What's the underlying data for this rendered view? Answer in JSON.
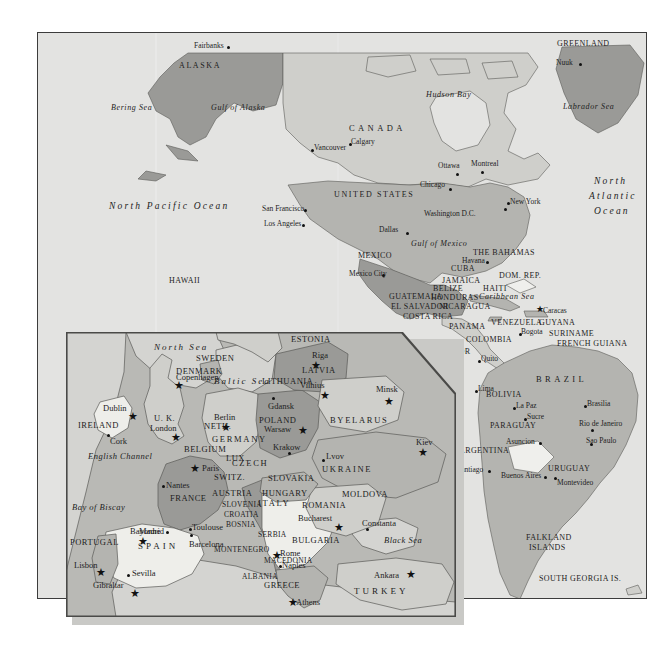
{
  "map": {
    "title": "World map with Europe inset",
    "colors": {
      "ocean": "#e3e3e1",
      "land_light": "#cfcfcb",
      "land_mid": "#b4b4b0",
      "land_dark": "#9a9a97",
      "land_white": "#efefec",
      "border": "#3c3c3c",
      "inset_shadow": "#c9c9c6",
      "text": "#1d1d1d"
    },
    "world": {
      "oceans": [
        {
          "name": "Bering Sea",
          "x": 110,
          "y": 107
        },
        {
          "name": "Gulf of Alaska",
          "x": 210,
          "y": 107
        },
        {
          "name": "North Pacific Ocean",
          "x": 108,
          "y": 205
        },
        {
          "name": "Hudson Bay",
          "x": 425,
          "y": 94
        },
        {
          "name": "Labrador Sea",
          "x": 562,
          "y": 106
        },
        {
          "name": "North",
          "x": 593,
          "y": 180
        },
        {
          "name": "Atlantic",
          "x": 588,
          "y": 195
        },
        {
          "name": "Ocean",
          "x": 593,
          "y": 210
        },
        {
          "name": "Gulf of Mexico",
          "x": 410,
          "y": 243
        },
        {
          "name": "Caribbean Sea",
          "x": 478,
          "y": 296
        }
      ],
      "regions": [
        {
          "name": "ALASKA",
          "x": 178,
          "y": 65,
          "style": "country-mid"
        },
        {
          "name": "CANADA",
          "x": 348,
          "y": 127,
          "style": "country-big"
        },
        {
          "name": "UNITED  STATES",
          "x": 333,
          "y": 194,
          "style": "country-mid"
        },
        {
          "name": "GREENLAND",
          "x": 556,
          "y": 43,
          "style": "country"
        },
        {
          "name": "MEXICO",
          "x": 357,
          "y": 255,
          "style": "country"
        },
        {
          "name": "HAWAII",
          "x": 168,
          "y": 280,
          "style": "country"
        },
        {
          "name": "THE BAHAMAS",
          "x": 472,
          "y": 252,
          "style": "country"
        },
        {
          "name": "CUBA",
          "x": 450,
          "y": 268,
          "style": "country"
        },
        {
          "name": "JAMAICA",
          "x": 441,
          "y": 280,
          "style": "country"
        },
        {
          "name": "HAITI",
          "x": 482,
          "y": 288,
          "style": "country"
        },
        {
          "name": "DOM. REP.",
          "x": 498,
          "y": 275,
          "style": "country"
        },
        {
          "name": "BELIZE",
          "x": 432,
          "y": 288,
          "style": "country"
        },
        {
          "name": "GUATEMALA",
          "x": 388,
          "y": 296,
          "style": "country"
        },
        {
          "name": "HONDURAS",
          "x": 430,
          "y": 297,
          "style": "country"
        },
        {
          "name": "EL SALVADOR",
          "x": 390,
          "y": 306,
          "style": "country"
        },
        {
          "name": "NICARAGUA",
          "x": 438,
          "y": 306,
          "style": "country"
        },
        {
          "name": "COSTA RICA",
          "x": 402,
          "y": 316,
          "style": "country"
        },
        {
          "name": "PANAMA",
          "x": 448,
          "y": 326,
          "style": "country"
        },
        {
          "name": "VENEZUELA",
          "x": 490,
          "y": 322,
          "style": "country"
        },
        {
          "name": "GUYANA",
          "x": 538,
          "y": 322,
          "style": "country"
        },
        {
          "name": "SURINAME",
          "x": 548,
          "y": 333,
          "style": "country"
        },
        {
          "name": "FRENCH GUIANA",
          "x": 556,
          "y": 343,
          "style": "country"
        },
        {
          "name": "COLOMBIA",
          "x": 465,
          "y": 339,
          "style": "country"
        },
        {
          "name": "ECUADOR",
          "x": 428,
          "y": 351,
          "style": "country"
        },
        {
          "name": "PERU",
          "x": 439,
          "y": 374,
          "style": "country"
        },
        {
          "name": "BRAZIL",
          "x": 539,
          "y": 378,
          "style": "country-big"
        },
        {
          "name": "BOLIVIA",
          "x": 485,
          "y": 394,
          "style": "country"
        },
        {
          "name": "PARAGUAY",
          "x": 489,
          "y": 425,
          "style": "country"
        },
        {
          "name": "CHILE",
          "x": 437,
          "y": 437,
          "style": "country"
        },
        {
          "name": "ARGENTINA",
          "x": 458,
          "y": 450,
          "style": "country"
        },
        {
          "name": "URUGUAY",
          "x": 547,
          "y": 468,
          "style": "country"
        },
        {
          "name": "FALKLAND",
          "x": 525,
          "y": 537,
          "style": "country"
        },
        {
          "name": "ISLANDS",
          "x": 528,
          "y": 547,
          "style": "country"
        },
        {
          "name": "SOUTH GEORGIA IS.",
          "x": 562,
          "y": 578,
          "style": "country"
        }
      ],
      "cities": [
        {
          "name": "Fairbanks",
          "x": 189,
          "y": 45,
          "dx": 31,
          "dy": 9,
          "marker": "dot"
        },
        {
          "name": "Vancouver",
          "x": 310,
          "y": 145,
          "dx": -6,
          "dy": -1,
          "marker": "dot"
        },
        {
          "name": "Calgary",
          "x": 348,
          "y": 144,
          "dx": -4,
          "dy": 8,
          "marker": "dot"
        },
        {
          "name": "Ottawa",
          "x": 452,
          "y": 168,
          "dx": 12,
          "dy": 9,
          "marker": "dot"
        },
        {
          "name": "Montreal",
          "x": 478,
          "y": 166,
          "dx": 9,
          "dy": 10,
          "marker": "dot"
        },
        {
          "name": "Chicago",
          "x": 415,
          "y": 184,
          "dx": 24,
          "dy": 9,
          "marker": "dot"
        },
        {
          "name": "New York",
          "x": 485,
          "y": 202,
          "dx": -4,
          "dy": -1,
          "marker": "dot"
        },
        {
          "name": "Washington D.C.",
          "x": 424,
          "y": 211,
          "dx": 54,
          "dy": 1,
          "marker": "dot"
        },
        {
          "name": "San Francisco",
          "x": 263,
          "y": 208,
          "dx": 49,
          "dy": 1,
          "marker": "dot"
        },
        {
          "name": "Los Angeles",
          "x": 272,
          "y": 223,
          "dx": 44,
          "dy": 1,
          "marker": "dot"
        },
        {
          "name": "Dallas",
          "x": 378,
          "y": 228,
          "dx": 24,
          "dy": 6,
          "marker": "dot"
        },
        {
          "name": "Mexico City",
          "x": 368,
          "y": 273,
          "dx": 34,
          "dy": 5,
          "marker": "dot"
        },
        {
          "name": "Havana",
          "x": 440,
          "y": 262,
          "dx": 26,
          "dy": 3,
          "marker": "dot"
        },
        {
          "name": "Nuuk",
          "x": 540,
          "y": 62,
          "dx": 22,
          "dy": 1,
          "marker": "dot"
        },
        {
          "name": "Caracas",
          "x": 510,
          "y": 310,
          "dx": -3,
          "dy": 6,
          "marker": "star"
        },
        {
          "name": "Bogota",
          "x": 487,
          "y": 330,
          "dx": -1,
          "dy": 6,
          "marker": "dot"
        },
        {
          "name": "Quito",
          "x": 442,
          "y": 360,
          "dx": 0,
          "dy": 5,
          "marker": "dot"
        },
        {
          "name": "Lima",
          "x": 443,
          "y": 388,
          "dx": 1,
          "dy": 5,
          "marker": "dot"
        },
        {
          "name": "La Paz",
          "x": 490,
          "y": 403,
          "dx": -1,
          "dy": 6,
          "marker": "dot"
        },
        {
          "name": "Sucre",
          "x": 497,
          "y": 412,
          "dx": 2,
          "dy": 6,
          "marker": "dot"
        },
        {
          "name": "Brasilia",
          "x": 578,
          "y": 399,
          "dx": -3,
          "dy": 6,
          "marker": "dot"
        },
        {
          "name": "Rio de Janeiro",
          "x": 580,
          "y": 420,
          "dx": 4,
          "dy": 6,
          "marker": "dot"
        },
        {
          "name": "Sao Paulo",
          "x": 580,
          "y": 436,
          "dx": 2,
          "dy": 3,
          "marker": "dot"
        },
        {
          "name": "Asuncion",
          "x": 484,
          "y": 437,
          "dx": 0,
          "dy": 5,
          "marker": "dot"
        },
        {
          "name": "Santiago",
          "x": 439,
          "y": 466,
          "dx": 0,
          "dy": 6,
          "marker": "dot"
        },
        {
          "name": "Buenos Aires",
          "x": 470,
          "y": 472,
          "dx": 0,
          "dy": 6,
          "marker": "dot"
        },
        {
          "name": "Montevideo",
          "x": 547,
          "y": 478,
          "dx": -2,
          "dy": 2,
          "marker": "dot"
        }
      ]
    },
    "europe": {
      "oceans": [
        {
          "name": "North Sea",
          "x": 98,
          "y": 17
        },
        {
          "name": "Baltic Sea",
          "x": 167,
          "y": 50
        },
        {
          "name": "English Channel",
          "x": 30,
          "y": 125
        },
        {
          "name": "Bay of Biscay",
          "x": 6,
          "y": 175
        },
        {
          "name": "Black Sea",
          "x": 324,
          "y": 210
        }
      ],
      "regions": [
        {
          "name": "ESTONIA",
          "x": 252,
          "y": 6,
          "style": "e-country"
        },
        {
          "name": "SWEDEN",
          "x": 146,
          "y": 25,
          "style": "e-country"
        },
        {
          "name": "DENMARK",
          "x": 110,
          "y": 34,
          "style": "e-country"
        },
        {
          "name": "LATVIA",
          "x": 256,
          "y": 36,
          "style": "e-country"
        },
        {
          "name": "LITHUANIA",
          "x": 228,
          "y": 48,
          "style": "e-country"
        },
        {
          "name": "IRELAND",
          "x": 12,
          "y": 92,
          "style": "e-country"
        },
        {
          "name": "U. K.",
          "x": 92,
          "y": 81,
          "style": "e-country"
        },
        {
          "name": "NETH.",
          "x": 142,
          "y": 86,
          "style": "e-country"
        },
        {
          "name": "BELGIUM",
          "x": 125,
          "y": 112,
          "style": "e-country"
        },
        {
          "name": "LUX.",
          "x": 160,
          "y": 121,
          "style": "e-country"
        },
        {
          "name": "GERMANY",
          "x": 164,
          "y": 105,
          "style": "e-country-md"
        },
        {
          "name": "POLAND",
          "x": 212,
          "y": 85,
          "style": "e-country"
        },
        {
          "name": "BYELARUS",
          "x": 294,
          "y": 85,
          "style": "e-country-md"
        },
        {
          "name": "CZECH",
          "x": 184,
          "y": 127,
          "style": "e-country-md"
        },
        {
          "name": "SLOVAKIA",
          "x": 222,
          "y": 142,
          "style": "e-country"
        },
        {
          "name": "UKRAINE",
          "x": 288,
          "y": 134,
          "style": "e-country-md"
        },
        {
          "name": "AUSTRIA",
          "x": 173,
          "y": 157,
          "style": "e-country"
        },
        {
          "name": "HUNGARY",
          "x": 217,
          "y": 157,
          "style": "e-country"
        },
        {
          "name": "MOLDOVA",
          "x": 304,
          "y": 158,
          "style": "e-country"
        },
        {
          "name": "SLOVENIA",
          "x": 178,
          "y": 168,
          "style": "e-small"
        },
        {
          "name": "ROMANIA",
          "x": 258,
          "y": 169,
          "style": "e-country"
        },
        {
          "name": "CROATIA",
          "x": 178,
          "y": 178,
          "style": "e-small"
        },
        {
          "name": "BOSNIA",
          "x": 181,
          "y": 188,
          "style": "e-small"
        },
        {
          "name": "SERBIA",
          "x": 208,
          "y": 198,
          "style": "e-small"
        },
        {
          "name": "BULGARIA",
          "x": 244,
          "y": 206,
          "style": "e-country"
        },
        {
          "name": "MONTENEGRO",
          "x": 182,
          "y": 213,
          "style": "e-small"
        },
        {
          "name": "MACEDONIA",
          "x": 220,
          "y": 224,
          "style": "e-small"
        },
        {
          "name": "ALBANIA",
          "x": 194,
          "y": 240,
          "style": "e-small"
        },
        {
          "name": "GREECE",
          "x": 215,
          "y": 249,
          "style": "e-country"
        },
        {
          "name": "TURKEY",
          "x": 300,
          "y": 256,
          "style": "e-country-sp"
        },
        {
          "name": "FRANCE",
          "x": 110,
          "y": 164,
          "style": "e-country"
        },
        {
          "name": "SWITZ.",
          "x": 152,
          "y": 141,
          "style": "e-country"
        },
        {
          "name": "ITALY",
          "x": 197,
          "y": 168,
          "style": "e-country-md"
        },
        {
          "name": "SPAIN",
          "x": 85,
          "y": 212,
          "style": "e-country-sp"
        },
        {
          "name": "PORTUGAL",
          "x": 8,
          "y": 208,
          "style": "e-country"
        }
      ],
      "cities": [
        {
          "name": "Riga",
          "x": 254,
          "y": 25,
          "dx": -2,
          "dy": 7,
          "marker": "star"
        },
        {
          "name": "Vilnius",
          "x": 245,
          "y": 58,
          "dx": -3,
          "dy": 8,
          "marker": "star"
        },
        {
          "name": "Minsk",
          "x": 317,
          "y": 58,
          "dx": -1,
          "dy": 8,
          "marker": "star"
        },
        {
          "name": "Copenhagen",
          "x": 118,
          "y": 46,
          "dx": -5,
          "dy": 8,
          "marker": "star"
        },
        {
          "name": "Gdansk",
          "x": 207,
          "y": 70,
          "dx": 6,
          "dy": 6,
          "marker": "dot"
        },
        {
          "name": "Berlin",
          "x": 153,
          "y": 88,
          "dx": -2,
          "dy": 8,
          "marker": "star"
        },
        {
          "name": "Warsaw",
          "x": 225,
          "y": 95,
          "dx": -4,
          "dy": 8,
          "marker": "star"
        },
        {
          "name": "Kiev",
          "x": 360,
          "y": 108,
          "dx": -4,
          "dy": 8,
          "marker": "star"
        },
        {
          "name": "Krakow",
          "x": 223,
          "y": 116,
          "dx": 6,
          "dy": 6,
          "marker": "dot"
        },
        {
          "name": "Lvov",
          "x": 260,
          "y": 123,
          "dx": 6,
          "dy": 5,
          "marker": "dot"
        },
        {
          "name": "Dublin",
          "x": 60,
          "y": 76,
          "dx": -4,
          "dy": 8,
          "marker": "star"
        },
        {
          "name": "London",
          "x": 108,
          "y": 97,
          "dx": -6,
          "dy": 8,
          "marker": "star"
        },
        {
          "name": "Cork",
          "x": 39,
          "y": 104,
          "dx": 6,
          "dy": 5,
          "marker": "dot"
        },
        {
          "name": "Paris",
          "x": 130,
          "y": 136,
          "dx": 7,
          "dy": 3,
          "marker": "star"
        },
        {
          "name": "Nantes",
          "x": 98,
          "y": 155,
          "dx": 6,
          "dy": 5,
          "marker": "dot"
        },
        {
          "name": "Bayonne",
          "x": 99,
          "y": 201,
          "dx": -3,
          "dy": 5,
          "marker": "dot"
        },
        {
          "name": "Toulouse",
          "x": 123,
          "y": 194,
          "dx": 4,
          "dy": 6,
          "marker": "dot"
        },
        {
          "name": "Madrid",
          "x": 78,
          "y": 198,
          "dx": -4,
          "dy": 8,
          "marker": "star"
        },
        {
          "name": "Barcelona",
          "x": 128,
          "y": 204,
          "dx": 4,
          "dy": 6,
          "marker": "dot"
        },
        {
          "name": "Sevilla",
          "x": 62,
          "y": 243,
          "dx": 6,
          "dy": 5,
          "marker": "dot"
        },
        {
          "name": "Lisbon",
          "x": 34,
          "y": 232,
          "dx": -4,
          "dy": 8,
          "marker": "star"
        },
        {
          "name": "Gibraltar",
          "x": 66,
          "y": 254,
          "dx": -3,
          "dy": 8,
          "marker": "star"
        },
        {
          "name": "Rome",
          "x": 220,
          "y": 218,
          "dx": -4,
          "dy": 8,
          "marker": "star"
        },
        {
          "name": "Naples",
          "x": 224,
          "y": 232,
          "dx": 2,
          "dy": 5,
          "marker": "dot"
        },
        {
          "name": "Bucharest",
          "x": 270,
          "y": 190,
          "dx": -4,
          "dy": 8,
          "marker": "star"
        },
        {
          "name": "Constanta",
          "x": 301,
          "y": 197,
          "dx": 4,
          "dy": 6,
          "marker": "dot"
        },
        {
          "name": "Athens",
          "x": 238,
          "y": 269,
          "dx": -4,
          "dy": 8,
          "marker": "star"
        },
        {
          "name": "Ankara",
          "x": 338,
          "y": 243,
          "dx": -4,
          "dy": 8,
          "marker": "star"
        }
      ]
    }
  }
}
